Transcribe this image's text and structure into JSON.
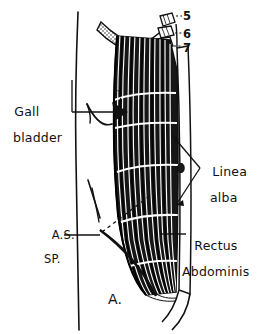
{
  "figure": {
    "caption": "A.",
    "view": "right anterolateral"
  },
  "labels": {
    "gall_bladder": {
      "line1": "Gall",
      "line2": "bladder"
    },
    "linea_alba": {
      "line1": "Linea",
      "line2": "alba"
    },
    "rectus_abdominis": {
      "line1": "Rectus",
      "line2": "Abdominis"
    },
    "asis": {
      "line1": "A.S.",
      "line2": "SP."
    }
  },
  "rib_numbers": {
    "five": "5",
    "six": "6",
    "seven": "7"
  },
  "colors": {
    "ink": "#111111",
    "paper": "#ffffff",
    "muscle_fill": "#1a1a1a",
    "tendon_white": "#ffffff"
  }
}
